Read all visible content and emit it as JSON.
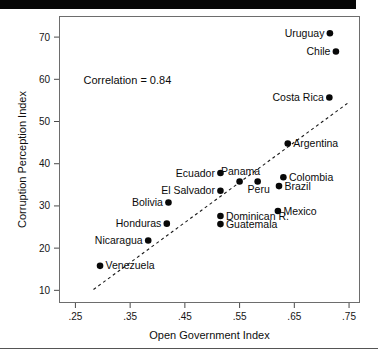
{
  "figure": {
    "background_color": "#ffffff",
    "frame_color": "#6d6d6d",
    "point_color": "#080808",
    "trend_color": "#1a1a1a"
  },
  "chart_data": {
    "type": "scatter",
    "title": "",
    "xlabel": "Open Government Index",
    "ylabel": "Corruption Perception Index",
    "xlim": [
      0.22,
      0.77
    ],
    "ylim": [
      7,
      75
    ],
    "xticks": [
      0.25,
      0.35,
      0.45,
      0.55,
      0.65,
      0.75
    ],
    "xticklabels": [
      ".25",
      ".35",
      ".45",
      ".55",
      ".65",
      ".75"
    ],
    "yticks": [
      10,
      20,
      30,
      40,
      50,
      60,
      70
    ],
    "yticklabels": [
      "10",
      "20",
      "30",
      "40",
      "50",
      "60",
      "70"
    ],
    "grid": false,
    "legend": null,
    "annotations": [
      {
        "name": "correlation-annotation",
        "text": "Correlation = 0.84",
        "x": 0.345,
        "y": 59.0
      }
    ],
    "trendline": {
      "name": "least-squares-fit",
      "style": "dashed",
      "x_start": 0.283,
      "y_start": 10.2,
      "x_end": 0.747,
      "y_end": 54.3
    },
    "points": [
      {
        "label": "Uruguay",
        "x": 0.715,
        "y": 70.9,
        "label_side": "left"
      },
      {
        "label": "Chile",
        "x": 0.726,
        "y": 66.6,
        "label_side": "left"
      },
      {
        "label": "Costa Rica",
        "x": 0.714,
        "y": 55.7,
        "label_side": "left"
      },
      {
        "label": "Argentina",
        "x": 0.638,
        "y": 44.8,
        "label_side": "right"
      },
      {
        "label": "Ecuador",
        "x": 0.515,
        "y": 37.8,
        "label_side": "left"
      },
      {
        "label": "Colombia",
        "x": 0.63,
        "y": 36.8,
        "label_side": "right"
      },
      {
        "label": "Panama",
        "x": 0.55,
        "y": 35.8,
        "label_side": "above"
      },
      {
        "label": "Peru",
        "x": 0.583,
        "y": 35.8,
        "label_side": "below"
      },
      {
        "label": "Brazil",
        "x": 0.622,
        "y": 34.7,
        "label_side": "right"
      },
      {
        "label": "El Salvador",
        "x": 0.515,
        "y": 33.6,
        "label_side": "left"
      },
      {
        "label": "Bolivia",
        "x": 0.42,
        "y": 30.8,
        "label_side": "left"
      },
      {
        "label": "Mexico",
        "x": 0.62,
        "y": 28.8,
        "label_side": "right"
      },
      {
        "label": "Dominican R.",
        "x": 0.515,
        "y": 27.6,
        "label_side": "right"
      },
      {
        "label": "Guatemala",
        "x": 0.515,
        "y": 25.7,
        "label_side": "right"
      },
      {
        "label": "Honduras",
        "x": 0.417,
        "y": 25.8,
        "label_side": "left"
      },
      {
        "label": "Nicaragua",
        "x": 0.383,
        "y": 21.8,
        "label_side": "left"
      },
      {
        "label": "Venezuela",
        "x": 0.295,
        "y": 15.8,
        "label_side": "right"
      }
    ]
  }
}
